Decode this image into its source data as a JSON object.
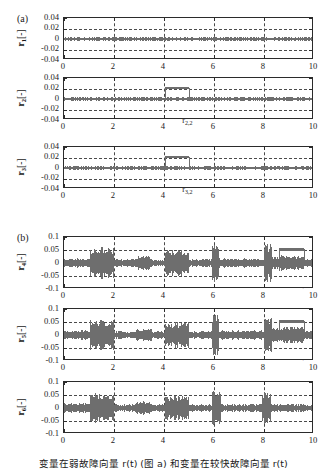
{
  "figure": {
    "panel_a_label": "(a)",
    "panel_b_label": "(b)",
    "xlabel": "时间[s]",
    "caption": "变量在弱故障向量  r(t)  (图 a) 和变量在较快故障向量  r(t)"
  },
  "chart_data": {
    "type": "line",
    "title": "",
    "xlabel": "时间[s]",
    "ylabel": "",
    "panels": [
      {
        "panel": "(a)",
        "xlim": [
          0,
          10
        ],
        "xticks": [
          0,
          2,
          4,
          6,
          8,
          10
        ],
        "xticklabels": [
          "0",
          "2",
          "4",
          "6",
          "8",
          "10"
        ],
        "ylim": [
          -0.04,
          0.04
        ],
        "yticks": [
          0.04,
          0.02,
          0,
          -0.02,
          -0.04
        ],
        "yticklabels": [
          "0.04",
          "0.02",
          "0",
          "-0.02",
          "-0.04"
        ],
        "grid": true,
        "subplots": [
          {
            "ylabel": "r₁[-]",
            "ylabel_base": "r",
            "ylabel_sub": "1",
            "ylabel_unit": "[-]",
            "noise_band": {
              "center": 0.0,
              "amplitude": 0.0035
            },
            "step": null,
            "annotations": []
          },
          {
            "ylabel": "r₂[-]",
            "ylabel_base": "r",
            "ylabel_sub": "2",
            "ylabel_unit": "[-]",
            "noise_band": {
              "center": 0.0,
              "amplitude": 0.0035
            },
            "step": {
              "t_start": 4.05,
              "t_end": 5.0,
              "level": 0.021,
              "thickness": 0.003
            },
            "annotations": [
              {
                "text": "r",
                "sub": "2,1",
                "target_t": 4.55,
                "target_y": 0.021,
                "place": "above"
              },
              {
                "text": "r",
                "sub": "2,2",
                "target_t": 4.45,
                "target_y": 0.0,
                "place": "below-arrow"
              }
            ]
          },
          {
            "ylabel": "r₃[-]",
            "ylabel_base": "r",
            "ylabel_sub": "3",
            "ylabel_unit": "[-]",
            "noise_band": {
              "center": 0.0,
              "amplitude": 0.0035
            },
            "step": {
              "t_start": 4.05,
              "t_end": 5.0,
              "level": 0.021,
              "thickness": 0.003
            },
            "annotations": [
              {
                "text": "r",
                "sub": "3,1",
                "target_t": 4.55,
                "target_y": 0.021,
                "place": "above"
              },
              {
                "text": "r",
                "sub": "3,2",
                "target_t": 4.45,
                "target_y": 0.0,
                "place": "below-arrow"
              }
            ]
          }
        ]
      },
      {
        "panel": "(b)",
        "xlim": [
          0,
          10
        ],
        "xticks": [
          0,
          2,
          4,
          6,
          8,
          10
        ],
        "xticklabels": [
          "0",
          "2",
          "4",
          "6",
          "8",
          "10"
        ],
        "ylim": [
          -0.1,
          0.1
        ],
        "yticks": [
          0.1,
          0.05,
          0,
          -0.05,
          -0.1
        ],
        "yticklabels": [
          "0.1",
          "0.05",
          "0",
          "-0.05",
          "-0.1"
        ],
        "grid": true,
        "subplots": [
          {
            "ylabel": "r₄[-]",
            "ylabel_base": "r",
            "ylabel_sub": "4",
            "ylabel_unit": "[-]",
            "bursts": [
              {
                "t_start": 0.0,
                "t_end": 1.05,
                "amplitude": 0.018
              },
              {
                "t_start": 1.05,
                "t_end": 2.0,
                "amplitude": 0.062
              },
              {
                "t_start": 2.0,
                "t_end": 2.9,
                "amplitude": 0.016
              },
              {
                "t_start": 2.9,
                "t_end": 3.5,
                "amplitude": 0.028
              },
              {
                "t_start": 3.5,
                "t_end": 4.05,
                "amplitude": 0.014
              },
              {
                "t_start": 4.05,
                "t_end": 5.0,
                "amplitude": 0.052
              },
              {
                "t_start": 5.0,
                "t_end": 5.95,
                "amplitude": 0.016
              },
              {
                "t_start": 5.95,
                "t_end": 6.2,
                "amplitude": 0.082
              },
              {
                "t_start": 6.2,
                "t_end": 8.0,
                "amplitude": 0.018
              },
              {
                "t_start": 8.0,
                "t_end": 8.3,
                "amplitude": 0.072
              },
              {
                "t_start": 8.3,
                "t_end": 8.6,
                "amplitude": 0.028
              },
              {
                "t_start": 8.6,
                "t_end": 9.6,
                "amplitude": 0.03
              },
              {
                "t_start": 9.6,
                "t_end": 10.0,
                "amplitude": 0.017
              }
            ],
            "step": {
              "t_start": 8.6,
              "t_end": 9.6,
              "level": 0.052,
              "thickness": 0.012
            },
            "annotations": [
              {
                "text": "r",
                "sub": "4,2",
                "target_t": 9.3,
                "target_y": 0.075,
                "place": "above-right"
              },
              {
                "text": "r",
                "sub": "4,1",
                "target_t": 8.95,
                "target_y": 0.0,
                "place": "below-arrow-right"
              }
            ]
          },
          {
            "ylabel": "r₅[-]",
            "ylabel_base": "r",
            "ylabel_sub": "5",
            "ylabel_unit": "[-]",
            "bursts": [
              {
                "t_start": 0.0,
                "t_end": 1.05,
                "amplitude": 0.018
              },
              {
                "t_start": 1.05,
                "t_end": 2.0,
                "amplitude": 0.06
              },
              {
                "t_start": 2.0,
                "t_end": 2.9,
                "amplitude": 0.016
              },
              {
                "t_start": 2.9,
                "t_end": 3.5,
                "amplitude": 0.026
              },
              {
                "t_start": 3.5,
                "t_end": 4.05,
                "amplitude": 0.014
              },
              {
                "t_start": 4.05,
                "t_end": 5.0,
                "amplitude": 0.05
              },
              {
                "t_start": 5.0,
                "t_end": 5.95,
                "amplitude": 0.016
              },
              {
                "t_start": 5.95,
                "t_end": 6.2,
                "amplitude": 0.085
              },
              {
                "t_start": 6.2,
                "t_end": 8.0,
                "amplitude": 0.018
              },
              {
                "t_start": 8.0,
                "t_end": 8.3,
                "amplitude": 0.075
              },
              {
                "t_start": 8.3,
                "t_end": 8.6,
                "amplitude": 0.03
              },
              {
                "t_start": 8.6,
                "t_end": 9.6,
                "amplitude": 0.032
              },
              {
                "t_start": 9.6,
                "t_end": 10.0,
                "amplitude": 0.017
              }
            ],
            "step": {
              "t_start": 8.6,
              "t_end": 9.6,
              "level": 0.052,
              "thickness": 0.012
            },
            "annotations": [
              {
                "text": "r",
                "sub": "5,2",
                "target_t": 9.3,
                "target_y": 0.075,
                "place": "above-right"
              },
              {
                "text": "r",
                "sub": "5,1",
                "target_t": 8.95,
                "target_y": 0.0,
                "place": "below-arrow-right"
              }
            ]
          },
          {
            "ylabel": "r₆[-]",
            "ylabel_base": "r",
            "ylabel_sub": "6",
            "ylabel_unit": "[-]",
            "bursts": [
              {
                "t_start": 0.0,
                "t_end": 1.05,
                "amplitude": 0.018
              },
              {
                "t_start": 1.05,
                "t_end": 2.0,
                "amplitude": 0.06
              },
              {
                "t_start": 2.0,
                "t_end": 2.9,
                "amplitude": 0.015
              },
              {
                "t_start": 2.9,
                "t_end": 3.5,
                "amplitude": 0.026
              },
              {
                "t_start": 3.5,
                "t_end": 4.05,
                "amplitude": 0.014
              },
              {
                "t_start": 4.05,
                "t_end": 5.0,
                "amplitude": 0.05
              },
              {
                "t_start": 5.0,
                "t_end": 5.95,
                "amplitude": 0.015
              },
              {
                "t_start": 5.95,
                "t_end": 6.25,
                "amplitude": 0.08
              },
              {
                "t_start": 6.25,
                "t_end": 7.95,
                "amplitude": 0.016
              },
              {
                "t_start": 7.95,
                "t_end": 8.25,
                "amplitude": 0.062
              },
              {
                "t_start": 8.25,
                "t_end": 10.0,
                "amplitude": 0.016
              }
            ],
            "step": null,
            "annotations": []
          }
        ]
      }
    ]
  },
  "colors": {
    "signal": "#6e6e6e",
    "axis": "#2b2b2b",
    "grid": "#4a4a4a",
    "text": "#1a1a1a",
    "background": "#ffffff"
  }
}
